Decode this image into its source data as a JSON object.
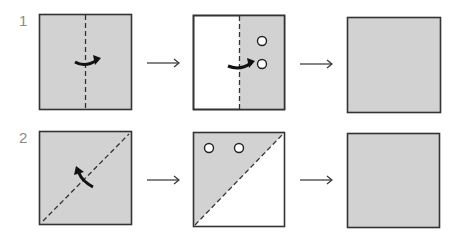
{
  "colors": {
    "paper": "#d2d2d2",
    "white": "#ffffff",
    "stroke": "#333333",
    "number": "#8a8a8a"
  },
  "steps": [
    {
      "number": "1",
      "panels": [
        {
          "fill": "gray",
          "fold_line": "vertical-center",
          "arrow": "curved-right"
        },
        {
          "fill": "right-half-gray",
          "fold_line": "vertical-center",
          "arrow": "curved-right",
          "circles": 2
        },
        {
          "fill": "gray"
        }
      ]
    },
    {
      "number": "2",
      "panels": [
        {
          "fill": "gray",
          "fold_line": "diagonal",
          "arrow": "curved-up-left"
        },
        {
          "fill": "upper-left-triangle-gray",
          "fold_line": "diagonal",
          "circles": 2
        },
        {
          "fill": "gray"
        }
      ]
    }
  ],
  "arrow_symbol": "→"
}
